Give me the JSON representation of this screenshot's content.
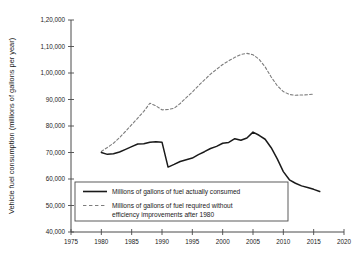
{
  "chart_data": {
    "type": "line",
    "title": "",
    "xlabel": "",
    "ylabel": "Vehicle fuel consumption (millions of gallons per year)",
    "xlim": [
      1975,
      2020
    ],
    "ylim": [
      40000,
      120000
    ],
    "grid": false,
    "legend_position": "lower-left-inside",
    "x_ticks": [
      1975,
      1980,
      1985,
      1990,
      1995,
      2000,
      2005,
      2010,
      2015,
      2020
    ],
    "x_tick_labels": [
      "1975",
      "1980",
      "1985",
      "1990",
      "1995",
      "2000",
      "2005",
      "2010",
      "2015",
      "2020"
    ],
    "y_ticks": [
      40000,
      50000,
      60000,
      70000,
      80000,
      90000,
      100000,
      110000,
      120000
    ],
    "y_tick_labels": [
      "40,000",
      "50,000",
      "60,000",
      "70,000",
      "80,000",
      "90,000",
      "1,00,000",
      "1,10,000",
      "1,20,000"
    ],
    "series": [
      {
        "name": "Millions of gallons of fuel actually consumed",
        "style": "solid",
        "color": "#1a1a1a",
        "x": [
          1980,
          1981,
          1982,
          1983,
          1984,
          1985,
          1986,
          1987,
          1988,
          1989,
          1990,
          1991,
          1992,
          1993,
          1994,
          1995,
          1996,
          1997,
          1998,
          1999,
          2000,
          2001,
          2002,
          2003,
          2004,
          2005,
          2006,
          2007,
          2008,
          2009,
          2010,
          2011,
          2012,
          2013,
          2014,
          2015,
          2016
        ],
        "values": [
          70000,
          69300,
          69500,
          70200,
          71200,
          72200,
          73200,
          73300,
          73900,
          74100,
          73900,
          64500,
          65500,
          66600,
          67300,
          67900,
          69200,
          70300,
          71500,
          72300,
          73500,
          73800,
          75200,
          74600,
          75500,
          77700,
          76500,
          75000,
          71800,
          67600,
          62800,
          59700,
          58400,
          57400,
          56800,
          56100,
          55300
        ]
      },
      {
        "name": "Millions of gallons of fuel required without efficiency improvements after 1980",
        "style": "dashed",
        "color": "#7d7d7d",
        "x": [
          1980,
          1981,
          1982,
          1983,
          1984,
          1985,
          1986,
          1987,
          1988,
          1989,
          1990,
          1991,
          1992,
          1993,
          1994,
          1995,
          1996,
          1997,
          1998,
          1999,
          2000,
          2001,
          2002,
          2003,
          2004,
          2005,
          2006,
          2007,
          2008,
          2009,
          2010,
          2011,
          2012,
          2013,
          2014,
          2015
        ],
        "values": [
          70400,
          71900,
          73500,
          75600,
          78000,
          80500,
          83000,
          85500,
          88600,
          87600,
          86100,
          86200,
          86700,
          88500,
          90700,
          92800,
          95200,
          97400,
          99600,
          101400,
          103200,
          104600,
          105900,
          107000,
          107400,
          106900,
          105200,
          102300,
          98500,
          95200,
          93000,
          91900,
          91600,
          91700,
          91800,
          92000
        ]
      }
    ]
  },
  "legend": {
    "entries": [
      {
        "label_line1": "Millions of gallons of fuel actually consumed",
        "label_line2": ""
      },
      {
        "label_line1": "Millions of gallons of fuel required without",
        "label_line2": "efficiency improvements after 1980"
      }
    ]
  },
  "colors": {
    "solid_series": "#1a1a1a",
    "dashed_series": "#7d7d7d",
    "axis": "#4a4a4a",
    "legend_border": "#4a4a4a",
    "background": "#ffffff"
  }
}
